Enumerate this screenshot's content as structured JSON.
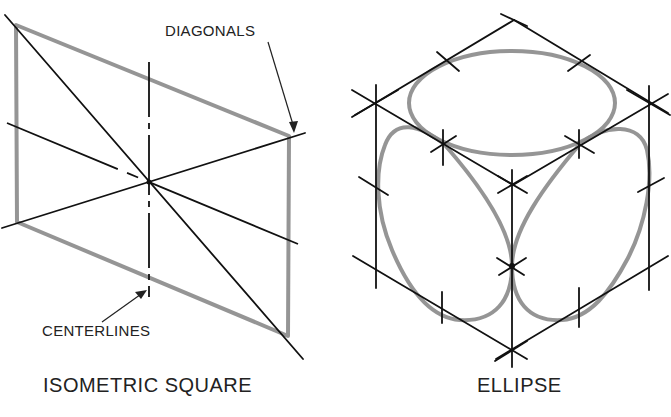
{
  "figures": {
    "left": {
      "caption": "ISOMETRIC SQUARE",
      "annotations": {
        "diagonals": "DIAGONALS",
        "centerlines": "CENTERLINES"
      }
    },
    "right": {
      "caption": "ELLIPSE"
    }
  },
  "colors": {
    "construction_line": "#111111",
    "sketched_outline": "#8a8a8a",
    "background": "#ffffff"
  }
}
